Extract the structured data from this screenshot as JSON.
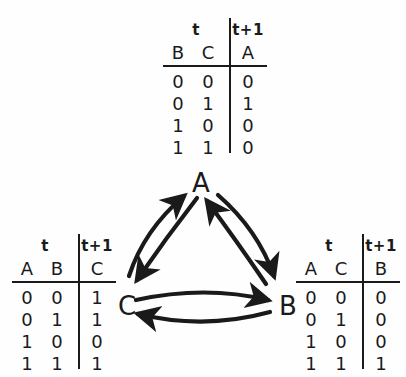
{
  "tables": {
    "top": {
      "name": "truth-table-A",
      "time_now_label": "t",
      "time_next_label": "t+1",
      "input_vars": [
        "B",
        "C"
      ],
      "output_var": "A",
      "rows": [
        {
          "inputs": [
            "0",
            "0"
          ],
          "output": "0"
        },
        {
          "inputs": [
            "0",
            "1"
          ],
          "output": "1"
        },
        {
          "inputs": [
            "1",
            "0"
          ],
          "output": "0"
        },
        {
          "inputs": [
            "1",
            "1"
          ],
          "output": "0"
        }
      ]
    },
    "left": {
      "name": "truth-table-C",
      "time_now_label": "t",
      "time_next_label": "t+1",
      "input_vars": [
        "A",
        "B"
      ],
      "output_var": "C",
      "rows": [
        {
          "inputs": [
            "0",
            "0"
          ],
          "output": "1"
        },
        {
          "inputs": [
            "0",
            "1"
          ],
          "output": "1"
        },
        {
          "inputs": [
            "1",
            "0"
          ],
          "output": "0"
        },
        {
          "inputs": [
            "1",
            "1"
          ],
          "output": "1"
        }
      ]
    },
    "right": {
      "name": "truth-table-B",
      "time_now_label": "t",
      "time_next_label": "t+1",
      "input_vars": [
        "A",
        "C"
      ],
      "output_var": "B",
      "rows": [
        {
          "inputs": [
            "0",
            "0"
          ],
          "output": "0"
        },
        {
          "inputs": [
            "0",
            "1"
          ],
          "output": "0"
        },
        {
          "inputs": [
            "1",
            "0"
          ],
          "output": "0"
        },
        {
          "inputs": [
            "1",
            "1"
          ],
          "output": "1"
        }
      ]
    }
  },
  "network": {
    "nodes": [
      {
        "id": "A",
        "label": "A"
      },
      {
        "id": "B",
        "label": "B"
      },
      {
        "id": "C",
        "label": "C"
      }
    ],
    "edges": [
      {
        "from": "C",
        "to": "A"
      },
      {
        "from": "A",
        "to": "C"
      },
      {
        "from": "A",
        "to": "B"
      },
      {
        "from": "B",
        "to": "A"
      },
      {
        "from": "C",
        "to": "B"
      },
      {
        "from": "B",
        "to": "C"
      }
    ]
  },
  "colors": {
    "ink": "#1a1a1a",
    "background": "#fefefe"
  }
}
